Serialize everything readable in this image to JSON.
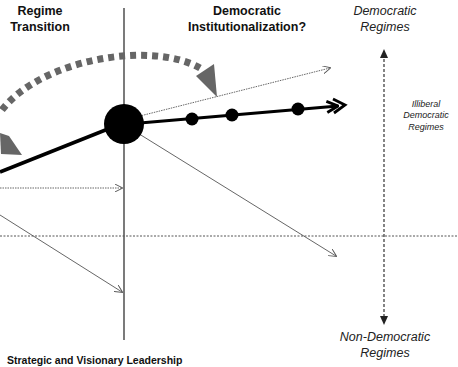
{
  "phases": {
    "regime_transition": {
      "line1": "Regime",
      "line2": "Transition"
    },
    "democratic_institutionalization": {
      "line1": "Democratic",
      "line2": "Institutionalization?"
    }
  },
  "regime_axis": {
    "top": {
      "line1": "Democratic",
      "line2": "Regimes"
    },
    "middle": {
      "line1": "Illiberal",
      "line2": "Democratic",
      "line3": "Regimes"
    },
    "bottom": {
      "line1": "Non-Democratic",
      "line2": "Regimes"
    }
  },
  "footer": {
    "text": "Strategic and Visionary Leadership"
  },
  "colors": {
    "main_path": "#000000",
    "dotted_arc": "#666666",
    "thin_arrows": "#555555",
    "axis_lines": "#333333",
    "background": "#ffffff"
  }
}
